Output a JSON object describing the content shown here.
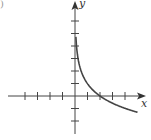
{
  "panel_label": ")",
  "chart_data": {
    "type": "line",
    "title": "",
    "xlabel": "x",
    "ylabel": "y",
    "xlim": [
      -4,
      5
    ],
    "ylim": [
      -2,
      6
    ],
    "grid": false,
    "x_ticks": [
      -4,
      -3,
      -2,
      -1,
      1,
      2,
      3,
      4
    ],
    "y_ticks": [
      -2,
      -1,
      1,
      2,
      3,
      4,
      5,
      6
    ],
    "tick_labels_shown": false,
    "series": [
      {
        "name": "curve",
        "description": "decreasing logarithmic curve, vertical asymptote at x=0, x-intercept at x=2",
        "x": [
          0.05,
          0.1,
          0.25,
          0.5,
          1,
          1.5,
          2,
          3,
          4,
          5
        ],
        "y": [
          5.2,
          4.2,
          2.9,
          1.9,
          1.0,
          0.4,
          0,
          -0.6,
          -1.0,
          -1.3
        ]
      }
    ],
    "color": "#444444"
  }
}
